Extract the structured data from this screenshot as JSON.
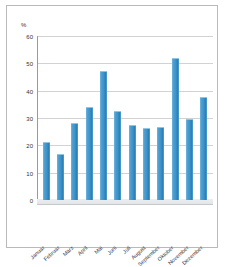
{
  "chart_data": {
    "type": "bar",
    "title": "",
    "xlabel": "",
    "ylabel": "%",
    "unit_label": "%",
    "ylim": [
      0,
      60
    ],
    "ytick_labels": [
      "0",
      "10",
      "20",
      "30",
      "40",
      "50",
      "60"
    ],
    "ytick_values": [
      0,
      10,
      20,
      30,
      40,
      50,
      60
    ],
    "grid": true,
    "legend": false,
    "bar_color": "#3e93c9",
    "categories": [
      "Januar",
      "Februar",
      "März",
      "April",
      "Mai",
      "Juni",
      "Juli",
      "August",
      "September",
      "Oktober",
      "November",
      "Dezember"
    ],
    "values": [
      21.3,
      16.8,
      28.0,
      34.0,
      47.3,
      32.4,
      27.4,
      26.4,
      26.8,
      51.8,
      29.6,
      37.8
    ]
  }
}
